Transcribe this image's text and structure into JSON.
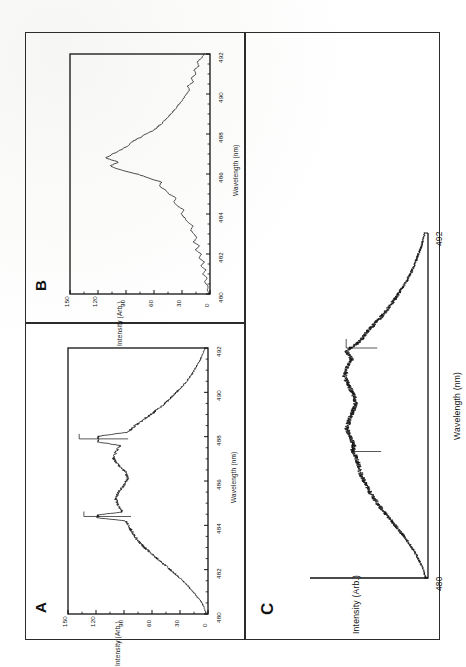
{
  "figure": {
    "orientation_note": "rotated-90-ccw",
    "panels": [
      {
        "letter": "A"
      },
      {
        "letter": "B"
      },
      {
        "letter": "C"
      }
    ]
  },
  "labels": {
    "panel_a": "A",
    "panel_b": "B",
    "panel_c": "C",
    "xlabel": "Wavelength (nm)",
    "ylabel": "Intensity (Arb.)"
  },
  "chart_data": [
    {
      "id": "panel-a",
      "type": "line",
      "title": "A",
      "xlabel": "Wavelength (nm)",
      "ylabel": "Intensity (Arb.)",
      "xlim": [
        480,
        492
      ],
      "ylim": [
        0,
        150
      ],
      "xticks": [
        480,
        482,
        484,
        486,
        488,
        490,
        492
      ],
      "yticks": [
        0,
        30,
        60,
        90,
        120,
        150
      ],
      "xtick_labels": [
        "480",
        "482",
        "484",
        "486",
        "488",
        "490",
        "492"
      ],
      "ytick_labels": [
        "0",
        "30",
        "60",
        "90",
        "120",
        "150"
      ],
      "minor_xticks": true,
      "grid": false,
      "legend": null,
      "annotations": [
        {
          "kind": "sharp-line",
          "x": 484.4,
          "height": 133
        },
        {
          "kind": "sharp-line",
          "x": 487.9,
          "height": 138
        }
      ],
      "x": [
        480.0,
        480.3,
        480.6,
        480.9,
        481.2,
        481.5,
        481.8,
        482.1,
        482.4,
        482.7,
        483.0,
        483.3,
        483.6,
        483.9,
        484.2,
        484.4,
        484.6,
        484.9,
        485.2,
        485.5,
        485.8,
        486.1,
        486.4,
        486.7,
        487.0,
        487.3,
        487.6,
        487.9,
        488.2,
        488.5,
        488.8,
        489.1,
        489.4,
        489.7,
        490.0,
        490.3,
        490.6,
        490.9,
        491.2,
        491.5,
        491.8,
        492.0
      ],
      "values": [
        2,
        4,
        8,
        14,
        20,
        27,
        35,
        43,
        52,
        60,
        68,
        75,
        80,
        84,
        88,
        133,
        92,
        96,
        99,
        96,
        90,
        86,
        88,
        96,
        101,
        99,
        94,
        138,
        86,
        78,
        68,
        58,
        49,
        41,
        34,
        27,
        21,
        16,
        12,
        8,
        5,
        3
      ]
    },
    {
      "id": "panel-b",
      "type": "line",
      "title": "B",
      "xlabel": "Wavelength (nm)",
      "ylabel": "Intensity (Arb.)",
      "xlim": [
        480,
        492
      ],
      "ylim": [
        0,
        150
      ],
      "xticks": [
        480,
        482,
        484,
        486,
        488,
        490,
        492
      ],
      "yticks": [
        0,
        30,
        60,
        90,
        120,
        150
      ],
      "xtick_labels": [
        "480",
        "482",
        "484",
        "486",
        "488",
        "490",
        "492"
      ],
      "ytick_labels": [
        "0",
        "30",
        "60",
        "90",
        "120",
        "150"
      ],
      "minor_xticks": true,
      "grid": false,
      "legend": null,
      "annotations": [],
      "x": [
        480.0,
        480.2,
        480.4,
        480.6,
        480.8,
        481.0,
        481.2,
        481.4,
        481.6,
        481.8,
        482.0,
        482.2,
        482.4,
        482.6,
        482.8,
        483.0,
        483.2,
        483.4,
        483.6,
        483.8,
        484.0,
        484.2,
        484.4,
        484.6,
        484.8,
        485.0,
        485.2,
        485.4,
        485.6,
        485.8,
        486.0,
        486.2,
        486.4,
        486.6,
        486.8,
        487.0,
        487.2,
        487.4,
        487.6,
        487.8,
        488.0,
        488.2,
        488.4,
        488.6,
        488.8,
        489.0,
        489.2,
        489.4,
        489.6,
        489.8,
        490.0,
        490.2,
        490.4,
        490.6,
        490.8,
        491.0,
        491.2,
        491.4,
        491.6,
        491.8,
        492.0
      ],
      "values": [
        1,
        3,
        2,
        6,
        3,
        8,
        4,
        10,
        6,
        12,
        9,
        16,
        11,
        18,
        14,
        17,
        21,
        18,
        24,
        27,
        31,
        28,
        35,
        39,
        36,
        44,
        47,
        55,
        52,
        66,
        78,
        95,
        108,
        98,
        112,
        104,
        96,
        88,
        84,
        76,
        68,
        60,
        55,
        50,
        46,
        42,
        38,
        35,
        31,
        28,
        25,
        22,
        24,
        18,
        20,
        15,
        17,
        12,
        14,
        9,
        6
      ]
    },
    {
      "id": "panel-c",
      "type": "line",
      "title": "C",
      "xlabel": "Wavelength (nm)",
      "ylabel": "Intensity (Arb.)",
      "xlim": [
        480,
        492
      ],
      "ylim": [
        0,
        150
      ],
      "xticks": [
        480,
        492
      ],
      "yticks": [],
      "xtick_labels": [
        "480",
        "492"
      ],
      "ytick_labels": [],
      "minor_xticks": false,
      "grid": false,
      "legend": null,
      "annotations": [
        {
          "kind": "sharp-line",
          "x": 484.4,
          "height": 96
        },
        {
          "kind": "sharp-line",
          "x": 488.0,
          "height": 104
        }
      ],
      "x": [
        480.0,
        480.3,
        480.6,
        480.9,
        481.2,
        481.5,
        481.8,
        482.1,
        482.4,
        482.7,
        483.0,
        483.3,
        483.6,
        483.9,
        484.2,
        484.4,
        484.6,
        484.9,
        485.2,
        485.5,
        485.8,
        486.1,
        486.4,
        486.7,
        487.0,
        487.3,
        487.6,
        487.9,
        488.2,
        488.5,
        488.8,
        489.1,
        489.4,
        489.7,
        490.0,
        490.3,
        490.6,
        490.9,
        491.2,
        491.5,
        491.8,
        492.0
      ],
      "values": [
        3,
        6,
        11,
        17,
        24,
        32,
        41,
        50,
        59,
        67,
        74,
        80,
        85,
        88,
        91,
        96,
        94,
        99,
        103,
        100,
        95,
        92,
        95,
        101,
        106,
        103,
        97,
        104,
        88,
        79,
        69,
        59,
        50,
        42,
        35,
        28,
        22,
        17,
        13,
        9,
        6,
        4
      ]
    }
  ]
}
